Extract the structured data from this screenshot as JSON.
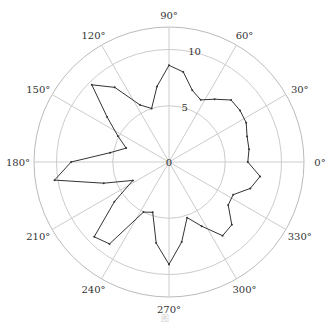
{
  "chart_data": {
    "type": "line",
    "subtype": "polar",
    "title": "",
    "theta_unit": "degrees",
    "theta_ticks": [
      0,
      30,
      60,
      90,
      120,
      150,
      180,
      210,
      240,
      270,
      300,
      330
    ],
    "theta_tick_labels": [
      "0°",
      "30°",
      "60°",
      "90°",
      "120°",
      "150°",
      "180°",
      "210°",
      "240°",
      "270°",
      "300°",
      "330°"
    ],
    "r_ticks": [
      0,
      5,
      10
    ],
    "r_tick_labels": [
      "0",
      "5",
      "10"
    ],
    "rlim": [
      0,
      12
    ],
    "grid": true,
    "legend": null,
    "series": [
      {
        "name": "series1",
        "color": "#333333",
        "marker": "dot",
        "theta": [
          0,
          9,
          18,
          27,
          36,
          45,
          54,
          63,
          72,
          81,
          90,
          99,
          108,
          117,
          126,
          135,
          144,
          153,
          162,
          171,
          180,
          189,
          198,
          207,
          216,
          225,
          234,
          243,
          252,
          261,
          270,
          279,
          288,
          297,
          306,
          315,
          324,
          333,
          342,
          351
        ],
        "r": [
          7.0,
          7.2,
          7.3,
          7.7,
          7.8,
          7.8,
          6.9,
          6.2,
          6.7,
          8.1,
          8.6,
          6.8,
          5.0,
          5.7,
          8.2,
          9.7,
          6.8,
          5.1,
          4.0,
          5.3,
          8.7,
          10.3,
          6.1,
          3.6,
          6.0,
          9.4,
          9.0,
          5.0,
          4.7,
          7.3,
          9.1,
          7.2,
          5.2,
          6.4,
          8.1,
          7.9,
          6.5,
          6.4,
          7.6,
          8.2
        ]
      }
    ]
  },
  "caption": "图"
}
